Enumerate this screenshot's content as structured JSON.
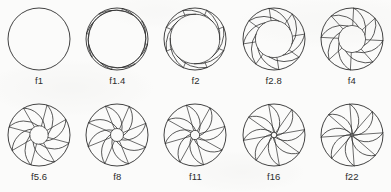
{
  "figure": {
    "blade_count": 8,
    "stroke_color": "#2e2e2e",
    "background_color": "#fbfbfa",
    "rows": 2,
    "columns": 5
  },
  "chart_data": {
    "type": "diagram",
    "xlabel": "",
    "ylabel": "",
    "categories": [
      "f1",
      "f1.4",
      "f2",
      "f2.8",
      "f4",
      "f5.6",
      "f8",
      "f11",
      "f16",
      "f22"
    ],
    "values": [
      1.0,
      0.93,
      0.8,
      0.6,
      0.44,
      0.3,
      0.21,
      0.15,
      0.09,
      0.04
    ],
    "value_meaning": "relative_opening_radius",
    "legend": []
  },
  "apertures": [
    {
      "label": "f1",
      "fstop": 1.0,
      "opening": 1.0,
      "blades": 8,
      "blade_rotation": 0,
      "fully_open": true
    },
    {
      "label": "f1.4",
      "fstop": 1.4,
      "opening": 0.93,
      "blades": 8,
      "blade_rotation": 10,
      "fully_open": false
    },
    {
      "label": "f2",
      "fstop": 2.0,
      "opening": 0.8,
      "blades": 8,
      "blade_rotation": 22,
      "fully_open": false
    },
    {
      "label": "f2.8",
      "fstop": 2.8,
      "opening": 0.6,
      "blades": 8,
      "blade_rotation": 36,
      "fully_open": false
    },
    {
      "label": "f4",
      "fstop": 4.0,
      "opening": 0.44,
      "blades": 8,
      "blade_rotation": 48,
      "fully_open": false
    },
    {
      "label": "f5.6",
      "fstop": 5.6,
      "opening": 0.3,
      "blades": 8,
      "blade_rotation": 60,
      "fully_open": false
    },
    {
      "label": "f8",
      "fstop": 8.0,
      "opening": 0.21,
      "blades": 8,
      "blade_rotation": 68,
      "fully_open": false
    },
    {
      "label": "f11",
      "fstop": 11.0,
      "opening": 0.15,
      "blades": 8,
      "blade_rotation": 74,
      "fully_open": false
    },
    {
      "label": "f16",
      "fstop": 16.0,
      "opening": 0.09,
      "blades": 8,
      "blade_rotation": 80,
      "fully_open": false
    },
    {
      "label": "f22",
      "fstop": 22.0,
      "opening": 0.04,
      "blades": 8,
      "blade_rotation": 86,
      "fully_open": false
    }
  ]
}
